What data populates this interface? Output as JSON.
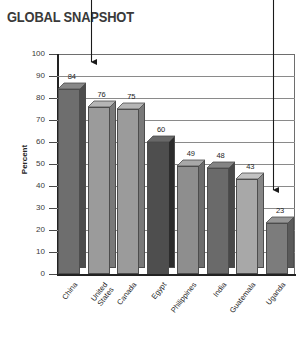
{
  "chart_data": {
    "type": "bar",
    "title": "GLOBAL SNAPSHOT",
    "xlabel": "",
    "ylabel": "Percent",
    "ylim": [
      0,
      100
    ],
    "yticks": [
      100,
      90,
      80,
      70,
      60,
      50,
      40,
      30,
      20,
      10,
      0
    ],
    "grid": true,
    "legend": "none",
    "categories": [
      "China",
      "United\nStates",
      "Canada",
      "Egypt",
      "Philippines",
      "India",
      "Guatemala",
      "Uganda"
    ],
    "values": [
      84,
      76,
      75,
      60,
      49,
      48,
      43,
      23
    ],
    "bar_colors": [
      "#6e6e6e",
      "#9b9b9b",
      "#9b9b9b",
      "#4e4e4e",
      "#8e8e8e",
      "#6a6a6a",
      "#a8a8a8",
      "#7c7c7c"
    ],
    "annotations": [
      {
        "label": "arrow-to-china",
        "target": "China"
      },
      {
        "label": "arrow-to-uganda",
        "target": "Uganda"
      }
    ]
  },
  "colors": {
    "axis": "#222222",
    "grid": "#8a8a8a",
    "text": "#262626",
    "title": "#3a3a3a",
    "arrow": "#1a1a1a"
  }
}
